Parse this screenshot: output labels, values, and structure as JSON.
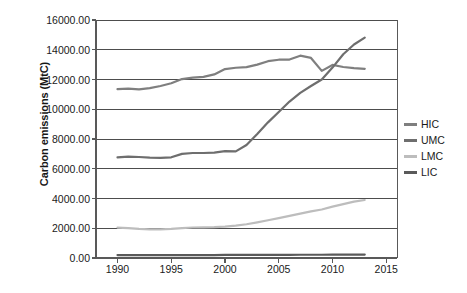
{
  "chart_data": {
    "type": "line",
    "title": "",
    "subtitle": "",
    "xlabel": "",
    "ylabel": "Carbon emissions (MtC)",
    "xlim": [
      1988,
      2016
    ],
    "ylim": [
      0,
      16000
    ],
    "grid": true,
    "grid_axis": "y",
    "legend_position": "right",
    "y_ticks": [
      0,
      2000,
      4000,
      6000,
      8000,
      10000,
      12000,
      14000,
      16000
    ],
    "y_tick_labels": [
      "0.00",
      "2000.00",
      "4000.00",
      "6000.00",
      "8000.00",
      "10000.00",
      "12000.00",
      "14000.00",
      "16000.00"
    ],
    "x_ticks": [
      1990,
      1995,
      2000,
      2005,
      2010,
      2015
    ],
    "x_tick_labels": [
      "1990",
      "1995",
      "2000",
      "2005",
      "2010",
      "2015"
    ],
    "x": [
      1990,
      1991,
      1992,
      1993,
      1994,
      1995,
      1996,
      1997,
      1998,
      1999,
      2000,
      2001,
      2002,
      2003,
      2004,
      2005,
      2006,
      2007,
      2008,
      2009,
      2010,
      2011,
      2012,
      2013
    ],
    "series": [
      {
        "name": "HIC",
        "color": "#7f7f7f",
        "values": [
          11350,
          11380,
          11340,
          11420,
          11560,
          11750,
          12030,
          12130,
          12180,
          12340,
          12700,
          12790,
          12830,
          13000,
          13230,
          13330,
          13340,
          13600,
          13450,
          12580,
          12980,
          12840,
          12760,
          12720
        ]
      },
      {
        "name": "UMC",
        "color": "#6e6e6e",
        "values": [
          6760,
          6820,
          6790,
          6750,
          6730,
          6770,
          7000,
          7060,
          7060,
          7090,
          7180,
          7170,
          7600,
          8340,
          9120,
          9820,
          10520,
          11100,
          11560,
          12000,
          12800,
          13700,
          14350,
          14820
        ]
      },
      {
        "name": "LMC",
        "color": "#bdbdbd",
        "values": [
          2040,
          2010,
          1960,
          1930,
          1930,
          1960,
          2010,
          2050,
          2060,
          2070,
          2110,
          2180,
          2270,
          2400,
          2540,
          2680,
          2830,
          2980,
          3130,
          3260,
          3450,
          3620,
          3790,
          3900
        ]
      },
      {
        "name": "LIC",
        "color": "#5a5a5a",
        "values": [
          200,
          200,
          200,
          195,
          195,
          195,
          200,
          200,
          200,
          200,
          205,
          205,
          205,
          210,
          210,
          215,
          215,
          220,
          220,
          220,
          225,
          225,
          230,
          230
        ]
      }
    ]
  },
  "legend": {
    "items": [
      {
        "label": "HIC"
      },
      {
        "label": "UMC"
      },
      {
        "label": "LMC"
      },
      {
        "label": "LIC"
      }
    ]
  },
  "axes": {
    "y_title": "Carbon emissions (MtC)"
  },
  "style": {
    "background": "#ffffff",
    "grid_color": "#4d4d4d",
    "axis_color": "#595959",
    "text_color": "#1a1a1a"
  }
}
